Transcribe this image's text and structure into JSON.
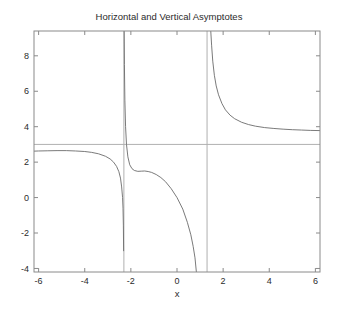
{
  "chart_data": {
    "type": "line",
    "title": "Horizontal and Vertical Asymptotes",
    "xlabel": "x",
    "ylabel": "",
    "xlim": [
      -6.2,
      6.2
    ],
    "ylim": [
      -4.2,
      9.4
    ],
    "xticks": [
      -6,
      -4,
      -2,
      0,
      2,
      4,
      6
    ],
    "xtick_labels": [
      "-6",
      "-4",
      "-2",
      "0",
      "2",
      "4",
      "6"
    ],
    "yticks": [
      -4,
      -2,
      0,
      2,
      4,
      6,
      8
    ],
    "ytick_labels": [
      "-4",
      "-2",
      "0",
      "2",
      "4",
      "6",
      "8"
    ],
    "grid": false,
    "legend": null,
    "curve_color": "#6b6b6b",
    "asymptote_color": "#b0b0b0",
    "axis_color": "#8a8a8a",
    "background": "#ffffff",
    "horizontal_asymptote": {
      "y": 3,
      "label": "y = 3"
    },
    "vertical_asymptotes": [
      {
        "x": -2.303,
        "label": "x = -2.30"
      },
      {
        "x": 1.303,
        "label": "x = 1.30"
      }
    ],
    "function_expression": "f(x) = (3x^2 + 2x - 40) / (x^2 + x - 3)",
    "series": [
      {
        "name": "left-branch",
        "x": [
          -6.2,
          -6,
          -5.6,
          -5.2,
          -4.8,
          -4.4,
          -4,
          -3.7,
          -3.4,
          -3.1,
          -2.9,
          -2.75,
          -2.62,
          -2.52,
          -2.45,
          -2.4,
          -2.36,
          -2.34,
          -2.325,
          -2.315
        ],
        "y": [
          2.62,
          2.63,
          2.64,
          2.65,
          2.65,
          2.63,
          2.6,
          2.55,
          2.47,
          2.33,
          2.18,
          2.0,
          1.76,
          1.46,
          1.1,
          0.6,
          0.0,
          -0.6,
          -1.6,
          -3.0
        ]
      },
      {
        "name": "middle-branch",
        "x": [
          -2.29,
          -2.28,
          -2.26,
          -2.23,
          -2.19,
          -2.13,
          -2.05,
          -1.95,
          -1.85,
          -1.7,
          -1.55,
          -1.4,
          -1.25,
          -1.1,
          -0.9,
          -0.7,
          -0.5,
          -0.25,
          0.0,
          0.25,
          0.45,
          0.6,
          0.7,
          0.78,
          0.84
        ],
        "y": [
          9.5,
          7.5,
          5.5,
          4.0,
          3.0,
          2.3,
          1.85,
          1.63,
          1.53,
          1.48,
          1.49,
          1.5,
          1.47,
          1.42,
          1.3,
          1.13,
          0.9,
          0.5,
          0.0,
          -0.65,
          -1.4,
          -2.1,
          -2.75,
          -3.4,
          -4.2
        ]
      },
      {
        "name": "right-branch",
        "x": [
          1.46,
          1.5,
          1.55,
          1.62,
          1.7,
          1.8,
          1.95,
          2.1,
          2.3,
          2.5,
          2.8,
          3.1,
          3.4,
          3.8,
          4.2,
          4.6,
          5.0,
          5.4,
          5.8,
          6.2
        ],
        "y": [
          9.5,
          8.6,
          7.7,
          6.9,
          6.3,
          5.8,
          5.3,
          4.95,
          4.65,
          4.45,
          4.25,
          4.12,
          4.03,
          3.95,
          3.9,
          3.86,
          3.83,
          3.81,
          3.79,
          3.78
        ]
      }
    ],
    "notable_points": [
      {
        "label": "local maximum of middle branch",
        "x": -1.4,
        "y": 1.5
      },
      {
        "label": "left branch at x = -6",
        "x": -6,
        "y": 2.63
      },
      {
        "label": "right branch at x = 6",
        "x": 6,
        "y": 3.79
      }
    ]
  }
}
